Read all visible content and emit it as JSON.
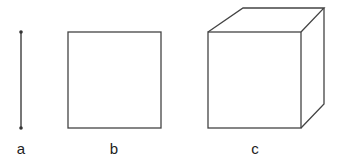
{
  "diagram": {
    "stroke_color": "#333333",
    "figures": [
      {
        "id": "a",
        "label": "a",
        "shape": "line segment",
        "dimension": 1
      },
      {
        "id": "b",
        "label": "b",
        "shape": "square",
        "dimension": 2
      },
      {
        "id": "c",
        "label": "c",
        "shape": "cube",
        "dimension": 3
      }
    ]
  }
}
